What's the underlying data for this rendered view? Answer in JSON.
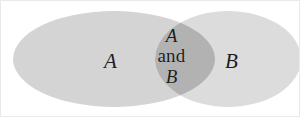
{
  "figure": {
    "background_color": "#ffffff",
    "border_color": "#e9e9e9",
    "width": 300,
    "height": 117
  },
  "sets": {
    "a": {
      "label": "A",
      "fill_color": "#d4d4d4",
      "center_x": 113,
      "center_y": 58,
      "radius_x": 101,
      "radius_y": 48
    },
    "b": {
      "label": "B",
      "fill_color": "#dcdcdc",
      "center_x": 227,
      "center_y": 58,
      "radius_x": 73,
      "radius_y": 48
    }
  },
  "intersection": {
    "label_line_1": "A",
    "label_line_2": "and",
    "label_line_3": "B",
    "label_full": "A and B",
    "fill_color": "#b2b2b2",
    "left_x": 140,
    "right_x": 201,
    "top_y": 12,
    "bottom_y": 105
  },
  "text_color": "#1c1c1c"
}
